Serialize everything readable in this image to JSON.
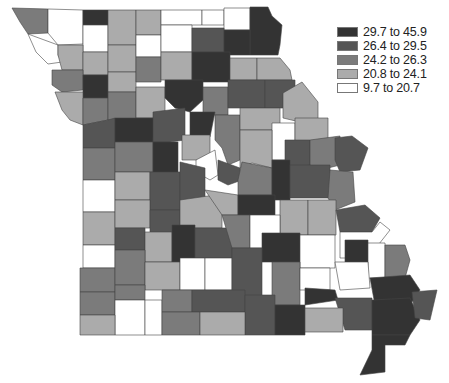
{
  "map": {
    "subject": "Missouri counties",
    "classes": [
      {
        "id": 1,
        "label": "29.7 to 45.9",
        "color": "#333333"
      },
      {
        "id": 2,
        "label": "26.4 to 29.5",
        "color": "#555555"
      },
      {
        "id": 3,
        "label": "24.2 to 26.3",
        "color": "#7b7b7b"
      },
      {
        "id": 4,
        "label": "20.8 to 24.1",
        "color": "#ababab"
      },
      {
        "id": 5,
        "label": "9.7 to 20.7",
        "color": "#ffffff"
      }
    ],
    "counties": [
      {
        "pts": "12,8 48,9 48,33 28,34 20,22",
        "c": 3
      },
      {
        "pts": "48,9 83,10 83,44 58,45 48,33",
        "c": 5
      },
      {
        "pts": "28,34 58,45 58,55 62,62 48,64 36,52",
        "c": 5
      },
      {
        "pts": "83,10 108,10 108,25 83,25",
        "c": 1
      },
      {
        "pts": "83,25 108,25 108,52 83,52",
        "c": 5
      },
      {
        "pts": "108,10 136,10 136,45 108,45",
        "c": 4
      },
      {
        "pts": "136,10 161,10 161,35 136,35",
        "c": 4
      },
      {
        "pts": "161,10 202,10 202,25 161,25",
        "c": 5
      },
      {
        "pts": "202,10 224,10 224,25 202,25",
        "c": 5
      },
      {
        "pts": "224,8 250,8 250,30 224,30",
        "c": 5
      },
      {
        "pts": "250,7 268,7 272,16 282,25 280,45 278,55 250,55 250,30",
        "c": 1
      },
      {
        "pts": "58,45 83,45 83,70 62,70 58,55",
        "c": 4
      },
      {
        "pts": "83,52 108,52 108,75 83,75",
        "c": 4
      },
      {
        "pts": "108,45 136,45 136,72 108,72",
        "c": 4
      },
      {
        "pts": "136,35 161,35 161,57 136,57",
        "c": 5
      },
      {
        "pts": "161,25 192,25 192,52 161,52",
        "c": 5
      },
      {
        "pts": "192,28 224,28 224,52 192,52",
        "c": 2
      },
      {
        "pts": "224,30 250,30 250,55 224,55",
        "c": 1
      },
      {
        "pts": "52,70 83,70 83,90 62,92 52,85",
        "c": 3
      },
      {
        "pts": "83,75 108,75 108,98 83,98",
        "c": 1
      },
      {
        "pts": "108,72 136,72 136,92 108,92",
        "c": 4
      },
      {
        "pts": "136,57 161,57 161,82 136,82",
        "c": 3
      },
      {
        "pts": "161,52 192,52 192,80 161,80",
        "c": 4
      },
      {
        "pts": "192,52 230,52 230,82 192,82",
        "c": 1
      },
      {
        "pts": "230,58 257,58 257,80 230,80",
        "c": 4
      },
      {
        "pts": "257,58 280,58 290,70 292,80 257,80",
        "c": 4
      },
      {
        "pts": "55,92 83,92 83,125 70,120 62,110",
        "c": 4
      },
      {
        "pts": "83,98 108,98 108,120 83,125",
        "c": 3
      },
      {
        "pts": "108,92 136,92 136,122 108,120",
        "c": 3
      },
      {
        "pts": "136,87 165,87 165,112 155,118 136,118",
        "c": 4
      },
      {
        "pts": "165,80 203,80 203,100 190,112 175,108 165,98",
        "c": 1
      },
      {
        "pts": "203,87 228,87 228,115 203,115",
        "c": 3
      },
      {
        "pts": "228,80 265,80 265,108 228,108",
        "c": 2
      },
      {
        "pts": "265,80 295,80 295,108 265,108",
        "c": 2
      },
      {
        "pts": "283,93 302,82 318,102 318,122 300,122 283,118",
        "c": 4
      },
      {
        "pts": "83,125 108,120 115,118 115,148 83,148",
        "c": 2
      },
      {
        "pts": "115,118 155,118 153,142 115,142",
        "c": 1
      },
      {
        "pts": "153,112 185,108 185,140 170,142 153,142",
        "c": 2
      },
      {
        "pts": "190,112 215,112 210,137 190,137",
        "c": 1
      },
      {
        "pts": "215,115 240,115 240,160 228,165 222,148 215,140",
        "c": 3
      },
      {
        "pts": "240,108 280,108 280,130 240,130",
        "c": 4
      },
      {
        "pts": "272,123 295,123 295,160 272,160",
        "c": 5
      },
      {
        "pts": "295,118 328,118 328,143 295,143",
        "c": 4
      },
      {
        "pts": "83,148 115,148 115,180 83,180",
        "c": 3
      },
      {
        "pts": "115,142 153,142 153,172 115,172",
        "c": 3
      },
      {
        "pts": "153,142 178,142 178,175 153,175",
        "c": 1
      },
      {
        "pts": "182,135 210,135 210,160 182,160",
        "c": 4
      },
      {
        "pts": "196,160 215,150 218,175 210,180 196,172",
        "c": 5
      },
      {
        "pts": "240,130 272,130 272,168 252,163 240,168",
        "c": 4
      },
      {
        "pts": "285,140 310,140 310,165 285,168",
        "c": 2
      },
      {
        "pts": "310,140 340,136 340,165 320,170 310,165",
        "c": 3
      },
      {
        "pts": "335,138 352,136 368,148 360,170 340,172 335,160",
        "c": 2
      },
      {
        "pts": "83,180 115,180 115,212 83,212",
        "c": 5
      },
      {
        "pts": "115,172 150,172 150,200 115,200",
        "c": 4
      },
      {
        "pts": "150,172 180,172 180,210 150,210",
        "c": 2
      },
      {
        "pts": "180,162 205,168 205,200 180,200",
        "c": 2
      },
      {
        "pts": "218,160 240,168 242,180 228,185 218,180",
        "c": 2
      },
      {
        "pts": "242,162 272,168 272,195 238,195 238,180",
        "c": 3
      },
      {
        "pts": "272,160 290,160 290,200 272,200",
        "c": 1
      },
      {
        "pts": "290,165 330,165 330,198 290,198",
        "c": 2
      },
      {
        "pts": "330,170 353,172 355,202 335,210 328,198",
        "c": 3
      },
      {
        "pts": "83,212 115,212 115,245 83,245",
        "c": 4
      },
      {
        "pts": "115,200 150,200 150,228 115,228",
        "c": 4
      },
      {
        "pts": "150,210 180,210 180,238 150,238",
        "c": 2
      },
      {
        "pts": "180,200 215,195 222,215 222,228 180,228",
        "c": 4
      },
      {
        "pts": "205,190 238,195 238,215 222,215",
        "c": 4
      },
      {
        "pts": "238,195 275,195 275,215 238,215",
        "c": 1
      },
      {
        "pts": "280,200 308,200 308,235 280,235",
        "c": 4
      },
      {
        "pts": "308,200 336,200 336,235 308,235",
        "c": 4
      },
      {
        "pts": "336,210 365,205 380,218 372,232 340,232",
        "c": 2
      },
      {
        "pts": "83,245 115,245 115,268 83,268",
        "c": 5
      },
      {
        "pts": "115,228 145,228 145,250 115,250",
        "c": 2
      },
      {
        "pts": "145,232 172,232 172,262 145,262",
        "c": 4
      },
      {
        "pts": "172,225 195,225 195,262 172,262",
        "c": 1
      },
      {
        "pts": "195,228 232,228 232,258 195,258",
        "c": 2
      },
      {
        "pts": "222,215 250,215 250,248 232,248",
        "c": 3
      },
      {
        "pts": "250,215 280,215 280,248 250,248",
        "c": 5
      },
      {
        "pts": "262,233 300,233 300,262 262,262",
        "c": 1
      },
      {
        "pts": "300,235 335,235 335,268 300,268",
        "c": 5
      },
      {
        "pts": "340,232 372,232 380,222 390,230 368,258 340,258",
        "c": 5
      },
      {
        "pts": "345,240 368,240 368,262 345,262",
        "c": 1
      },
      {
        "pts": "368,243 385,243 385,278 368,278",
        "c": 5
      },
      {
        "pts": "385,245 405,245 410,260 405,278 385,278",
        "c": 3
      },
      {
        "pts": "80,268 115,268 115,292 80,292",
        "c": 3
      },
      {
        "pts": "115,250 145,250 145,285 115,285",
        "c": 3
      },
      {
        "pts": "145,262 180,262 180,290 145,290",
        "c": 4
      },
      {
        "pts": "180,258 205,258 205,290 180,290",
        "c": 5
      },
      {
        "pts": "205,258 232,258 232,290 205,290",
        "c": 5
      },
      {
        "pts": "232,248 262,248 262,300 232,300",
        "c": 2
      },
      {
        "pts": "272,262 300,262 300,305 272,305",
        "c": 3
      },
      {
        "pts": "300,268 330,268 330,290 300,290",
        "c": 5
      },
      {
        "pts": "335,262 368,262 370,288 340,290",
        "c": 5
      },
      {
        "pts": "370,278 410,275 420,290 410,305 375,305",
        "c": 1
      },
      {
        "pts": "80,292 115,292 115,315 80,315",
        "c": 3
      },
      {
        "pts": "115,285 145,285 145,300 115,300",
        "c": 3
      },
      {
        "pts": "115,300 145,300 145,335 115,335",
        "c": 5
      },
      {
        "pts": "145,300 162,300 162,335 145,335",
        "c": 5
      },
      {
        "pts": "162,290 192,290 192,312 162,312",
        "c": 3
      },
      {
        "pts": "192,290 245,290 245,312 192,312",
        "c": 2
      },
      {
        "pts": "245,295 275,295 275,335 245,335",
        "c": 2
      },
      {
        "pts": "305,288 335,290 338,300 305,305",
        "c": 1
      },
      {
        "pts": "335,298 372,298 372,330 345,330",
        "c": 2
      },
      {
        "pts": "372,300 410,298 420,320 410,335 372,335",
        "c": 1
      },
      {
        "pts": "412,292 437,290 430,320 415,318",
        "c": 2
      },
      {
        "pts": "80,315 115,315 115,335 80,335",
        "c": 4
      },
      {
        "pts": "162,312 200,312 200,335 162,335",
        "c": 3
      },
      {
        "pts": "200,312 245,312 245,335 200,335",
        "c": 4
      },
      {
        "pts": "275,305 305,305 305,335 275,335",
        "c": 1
      },
      {
        "pts": "305,308 343,308 343,332 305,332",
        "c": 4
      },
      {
        "pts": "372,335 410,335 405,345 385,345 385,372 360,375 372,350",
        "c": 1
      }
    ]
  }
}
